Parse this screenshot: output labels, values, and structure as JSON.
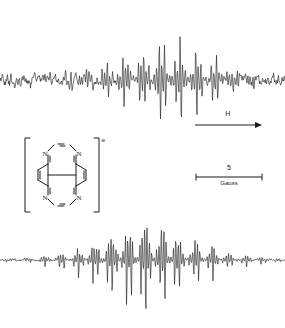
{
  "figure": {
    "kind": "esr-spectrum-figure",
    "background_color": "#ffffff",
    "trace_color": "#1a1a1a"
  },
  "field_arrow": {
    "label": "H",
    "direction": "right",
    "meaning": "increasing magnetic field"
  },
  "scale_bar": {
    "value": "5",
    "unit": "Gauss"
  },
  "molecule": {
    "name": "tetraazapyrene-radical-anion",
    "charge_symbol": "⊖",
    "atom_labels": [
      "N",
      "N",
      "N",
      "N"
    ],
    "bracket": "square"
  },
  "chart_data": [
    {
      "type": "line",
      "name": "experimental-esr-spectrum",
      "title": "",
      "xlabel": "H",
      "ylabel": "",
      "grid": false,
      "legend": "none",
      "xlim": [
        0,
        285
      ],
      "ylim": [
        -1,
        1
      ],
      "baseline": 0.0,
      "envelope": [
        0.05,
        0.06,
        0.07,
        0.08,
        0.1,
        0.12,
        0.15,
        0.19,
        0.24,
        0.3,
        0.38,
        0.47,
        0.57,
        0.68,
        0.79,
        0.9,
        0.97,
        1.0,
        0.97,
        0.9,
        0.8,
        0.68,
        0.56,
        0.45,
        0.35,
        0.27,
        0.21,
        0.16,
        0.12,
        0.09,
        0.07,
        0.06
      ],
      "noise_level": 0.05,
      "line_spacing_px": 2.6,
      "notes": "noisy experimental trace, asymmetric decay to the right"
    },
    {
      "type": "line",
      "name": "simulated-esr-spectrum",
      "title": "",
      "xlabel": "H",
      "ylabel": "",
      "grid": false,
      "legend": "none",
      "xlim": [
        0,
        285
      ],
      "ylim": [
        -1,
        1
      ],
      "baseline": 0.0,
      "envelope": [
        0.03,
        0.04,
        0.05,
        0.07,
        0.09,
        0.12,
        0.16,
        0.21,
        0.28,
        0.36,
        0.46,
        0.57,
        0.69,
        0.81,
        0.91,
        0.98,
        1.0,
        0.98,
        0.91,
        0.81,
        0.69,
        0.57,
        0.46,
        0.36,
        0.28,
        0.21,
        0.16,
        0.12,
        0.09,
        0.07,
        0.05,
        0.03
      ],
      "noise_level": 0.01,
      "line_spacing_px": 2.4,
      "notes": "clean symmetric simulated trace with dense hyperfine lines"
    }
  ]
}
